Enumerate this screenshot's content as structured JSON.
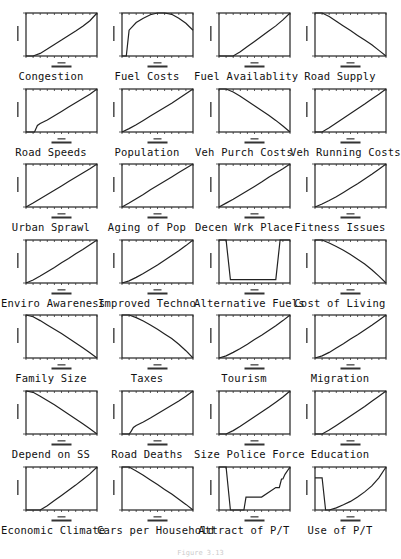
{
  "figure": {
    "caption": "Figure 3.13"
  },
  "chart_data": {
    "type": "line",
    "layout": {
      "rows": 7,
      "cols": 4,
      "grid": false,
      "legend": "none"
    },
    "shared_axes": {
      "xlim": [
        0,
        10
      ],
      "ylim": [
        0,
        1
      ],
      "xlabel": "Levels",
      "ylabel": "Relative Values"
    },
    "panels": [
      {
        "title": "Congestion",
        "x": [
          0,
          1,
          2,
          3,
          4,
          5,
          6,
          7,
          8,
          9,
          10
        ],
        "y": [
          0.0,
          0.0,
          0.06,
          0.16,
          0.27,
          0.37,
          0.48,
          0.58,
          0.69,
          0.82,
          1.0
        ]
      },
      {
        "title": "Fuel Costs",
        "x": [
          0,
          0.3,
          0.6,
          1,
          2,
          3,
          4,
          5,
          6,
          7,
          8,
          9,
          10
        ],
        "y": [
          0.0,
          0.0,
          0.0,
          0.6,
          0.78,
          0.88,
          0.96,
          1.0,
          1.0,
          0.97,
          0.88,
          0.76,
          0.6
        ]
      },
      {
        "title": "Fuel Availablity",
        "x": [
          0,
          1,
          2,
          3,
          4,
          5,
          6,
          7,
          8,
          9,
          10
        ],
        "y": [
          0.0,
          0.0,
          0.0,
          0.1,
          0.22,
          0.34,
          0.46,
          0.58,
          0.7,
          0.84,
          1.0
        ]
      },
      {
        "title": "Road Supply",
        "x": [
          0,
          1,
          2,
          3,
          4,
          5,
          6,
          7,
          8,
          9,
          10
        ],
        "y": [
          1.0,
          1.0,
          0.92,
          0.81,
          0.7,
          0.59,
          0.48,
          0.37,
          0.26,
          0.13,
          0.0
        ]
      },
      {
        "title": "Road Speeds",
        "x": [
          0,
          1,
          1.2,
          1.6,
          2,
          3,
          4,
          5,
          6,
          7,
          8,
          9,
          10
        ],
        "y": [
          0.0,
          0.0,
          0.0,
          0.15,
          0.2,
          0.28,
          0.38,
          0.48,
          0.58,
          0.68,
          0.78,
          0.88,
          1.0
        ]
      },
      {
        "title": "Population",
        "x": [
          0,
          1,
          2,
          3,
          4,
          5,
          6,
          7,
          8,
          9,
          10
        ],
        "y": [
          0.0,
          0.08,
          0.17,
          0.27,
          0.37,
          0.47,
          0.57,
          0.67,
          0.78,
          0.89,
          1.0
        ]
      },
      {
        "title": "Veh Purch Costs",
        "x": [
          0,
          1,
          2,
          3,
          4,
          5,
          6,
          7,
          8,
          9,
          10
        ],
        "y": [
          1.0,
          1.0,
          0.93,
          0.83,
          0.72,
          0.61,
          0.5,
          0.39,
          0.27,
          0.14,
          0.0
        ]
      },
      {
        "title": "Veh Running Costs",
        "x": [
          0,
          1,
          2,
          3,
          4,
          5,
          6,
          7,
          8,
          9,
          10
        ],
        "y": [
          0.0,
          0.0,
          0.1,
          0.21,
          0.32,
          0.43,
          0.54,
          0.65,
          0.77,
          0.88,
          1.0
        ]
      },
      {
        "title": "Urban Sprawl",
        "x": [
          0,
          1,
          2,
          3,
          4,
          5,
          6,
          7,
          8,
          9,
          10
        ],
        "y": [
          0.0,
          0.09,
          0.19,
          0.29,
          0.39,
          0.49,
          0.59,
          0.69,
          0.79,
          0.89,
          1.0
        ]
      },
      {
        "title": "Aging of Pop",
        "x": [
          0,
          1,
          2,
          3,
          4,
          5,
          6,
          7,
          8,
          9,
          10
        ],
        "y": [
          0.0,
          0.09,
          0.19,
          0.29,
          0.4,
          0.5,
          0.6,
          0.7,
          0.8,
          0.9,
          1.0
        ]
      },
      {
        "title": "Decen Wrk Place",
        "x": [
          0,
          1,
          2,
          3,
          4,
          5,
          6,
          7,
          8,
          9,
          10
        ],
        "y": [
          0.0,
          0.09,
          0.18,
          0.28,
          0.38,
          0.48,
          0.58,
          0.69,
          0.79,
          0.89,
          1.0
        ]
      },
      {
        "title": "Fitness Issues",
        "x": [
          0,
          1,
          2,
          3,
          4,
          5,
          6,
          7,
          8,
          9,
          10
        ],
        "y": [
          0.0,
          0.07,
          0.15,
          0.24,
          0.34,
          0.44,
          0.54,
          0.65,
          0.76,
          0.88,
          1.0
        ]
      },
      {
        "title": "Enviro Awareness",
        "x": [
          0,
          1,
          2,
          3,
          4,
          5,
          6,
          7,
          8,
          9,
          10
        ],
        "y": [
          0.0,
          0.07,
          0.16,
          0.26,
          0.36,
          0.47,
          0.57,
          0.68,
          0.78,
          0.89,
          1.0
        ]
      },
      {
        "title": "Improved Techno",
        "x": [
          0,
          1,
          2,
          3,
          4,
          5,
          6,
          7,
          8,
          9,
          10
        ],
        "y": [
          0.0,
          0.05,
          0.13,
          0.22,
          0.32,
          0.42,
          0.53,
          0.64,
          0.75,
          0.87,
          1.0
        ]
      },
      {
        "title": "Alternative Fuels",
        "x": [
          0,
          1,
          1.6,
          2,
          8,
          8.6,
          9,
          10
        ],
        "y": [
          1.0,
          1.0,
          0.08,
          0.08,
          0.08,
          1.0,
          1.0,
          1.0
        ]
      },
      {
        "title": "Cost of Living",
        "x": [
          0,
          1,
          2,
          3,
          4,
          5,
          6,
          7,
          8,
          9,
          10
        ],
        "y": [
          1.0,
          1.0,
          0.93,
          0.85,
          0.76,
          0.66,
          0.55,
          0.44,
          0.31,
          0.16,
          0.0
        ]
      },
      {
        "title": "Family Size",
        "x": [
          0,
          1,
          2,
          3,
          4,
          5,
          6,
          7,
          8,
          9,
          10
        ],
        "y": [
          1.0,
          0.96,
          0.87,
          0.77,
          0.67,
          0.57,
          0.46,
          0.35,
          0.24,
          0.12,
          0.0
        ]
      },
      {
        "title": "Taxes",
        "x": [
          0,
          1,
          2,
          3,
          4,
          5,
          6,
          7,
          8,
          9,
          10
        ],
        "y": [
          1.0,
          1.0,
          0.94,
          0.86,
          0.77,
          0.67,
          0.56,
          0.45,
          0.32,
          0.17,
          0.0
        ]
      },
      {
        "title": "Tourism",
        "x": [
          0,
          1,
          2,
          3,
          4,
          5,
          6,
          7,
          8,
          9,
          10
        ],
        "y": [
          0.0,
          0.05,
          0.13,
          0.22,
          0.32,
          0.43,
          0.53,
          0.64,
          0.75,
          0.87,
          1.0
        ]
      },
      {
        "title": "Migration",
        "x": [
          0,
          1,
          2,
          3,
          4,
          5,
          6,
          7,
          8,
          9,
          10
        ],
        "y": [
          0.0,
          0.05,
          0.13,
          0.23,
          0.33,
          0.44,
          0.54,
          0.65,
          0.76,
          0.88,
          1.0
        ]
      },
      {
        "title": "Depend on SS",
        "x": [
          0,
          1,
          2,
          3,
          4,
          5,
          6,
          7,
          8,
          9,
          10
        ],
        "y": [
          1.0,
          0.97,
          0.88,
          0.78,
          0.68,
          0.57,
          0.46,
          0.35,
          0.24,
          0.12,
          0.0
        ]
      },
      {
        "title": "Road Deaths",
        "x": [
          0,
          1,
          1.2,
          1.6,
          2,
          3,
          4,
          5,
          6,
          7,
          8,
          9,
          10
        ],
        "y": [
          0.0,
          0.0,
          0.04,
          0.15,
          0.2,
          0.28,
          0.37,
          0.47,
          0.57,
          0.67,
          0.77,
          0.88,
          1.0
        ]
      },
      {
        "title": "Size Police Force",
        "x": [
          0,
          1,
          2,
          3,
          4,
          5,
          6,
          7,
          8,
          9,
          10
        ],
        "y": [
          0.0,
          0.0,
          0.08,
          0.18,
          0.29,
          0.4,
          0.51,
          0.62,
          0.74,
          0.86,
          1.0
        ]
      },
      {
        "title": "Education",
        "x": [
          0,
          1,
          2,
          3,
          4,
          5,
          6,
          7,
          8,
          9,
          10
        ],
        "y": [
          0.0,
          0.0,
          0.09,
          0.2,
          0.31,
          0.42,
          0.53,
          0.64,
          0.76,
          0.88,
          1.0
        ]
      },
      {
        "title": "Economic Climate",
        "x": [
          0,
          1,
          2,
          3,
          4,
          5,
          6,
          7,
          8,
          9,
          10
        ],
        "y": [
          0.0,
          0.0,
          0.0,
          0.1,
          0.22,
          0.34,
          0.46,
          0.58,
          0.71,
          0.84,
          1.0
        ]
      },
      {
        "title": "Cars per Household",
        "x": [
          0,
          1,
          2,
          3,
          4,
          5,
          6,
          7,
          8,
          9,
          10
        ],
        "y": [
          1.0,
          1.0,
          0.91,
          0.81,
          0.7,
          0.59,
          0.48,
          0.37,
          0.25,
          0.13,
          0.0
        ]
      },
      {
        "title": "Attract of P/T",
        "x": [
          0,
          1,
          1.6,
          2,
          3.5,
          3.8,
          5,
          5.3,
          6,
          8,
          8.3,
          8.5,
          8.8,
          9,
          9.3,
          10
        ],
        "y": [
          1.0,
          1.0,
          0.0,
          0.0,
          0.0,
          0.3,
          0.3,
          0.3,
          0.3,
          0.52,
          0.52,
          0.52,
          0.72,
          0.72,
          0.83,
          1.0
        ]
      },
      {
        "title": "Use of P/T",
        "x": [
          0,
          1,
          1.5,
          2,
          3,
          4,
          5,
          6,
          7,
          8,
          9,
          10
        ],
        "y": [
          0.75,
          0.75,
          0.0,
          0.0,
          0.05,
          0.12,
          0.2,
          0.3,
          0.42,
          0.56,
          0.75,
          1.0
        ]
      }
    ]
  }
}
